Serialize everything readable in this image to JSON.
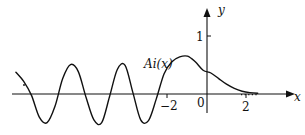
{
  "chart_data": {
    "type": "line",
    "title": "",
    "series": [
      {
        "name": "Ai(x)",
        "label": "Ai(x)",
        "x": [
          -9.8,
          -9.4,
          -9.0,
          -8.6,
          -8.2,
          -7.8,
          -7.4,
          -7.0,
          -6.6,
          -6.2,
          -5.8,
          -5.4,
          -5.0,
          -4.6,
          -4.2,
          -3.8,
          -3.4,
          -3.0,
          -2.6,
          -2.2,
          -1.8,
          -1.4,
          -1.0,
          -0.6,
          -0.2,
          0.2,
          0.6,
          1.0,
          1.4,
          1.8,
          2.2,
          2.6
        ],
        "y": [
          0.31,
          0.18,
          -0.02,
          -0.33,
          -0.41,
          -0.18,
          0.22,
          0.42,
          0.32,
          -0.05,
          -0.37,
          -0.41,
          -0.04,
          0.35,
          0.41,
          0.02,
          -0.37,
          -0.38,
          -0.07,
          0.29,
          0.46,
          0.53,
          0.54,
          0.46,
          0.34,
          0.3,
          0.22,
          0.14,
          0.08,
          0.04,
          0.02,
          0.01
        ]
      }
    ],
    "xlabel": "x",
    "ylabel": "y",
    "x_ticks": [
      {
        "value": -2,
        "label": "−2"
      },
      {
        "value": 0,
        "label": "0"
      },
      {
        "value": 2,
        "label": "2"
      }
    ],
    "y_ticks": [
      {
        "value": 1,
        "label": "1"
      }
    ],
    "xlim": [
      -10.3,
      3.8
    ],
    "ylim": [
      -0.55,
      1.5
    ],
    "grid": false,
    "legend": "inline label near peak",
    "continuation": "dotted tail after x=2 (…)"
  }
}
